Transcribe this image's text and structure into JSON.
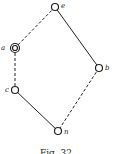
{
  "figure": {
    "caption": "Fig. 32",
    "nodes": [
      {
        "id": "e",
        "label": "e",
        "x": 55,
        "y": 7,
        "double": false
      },
      {
        "id": "a",
        "label": "a",
        "x": 15,
        "y": 48,
        "double": true
      },
      {
        "id": "b",
        "label": "b",
        "x": 99,
        "y": 68,
        "double": false
      },
      {
        "id": "c",
        "label": "c",
        "x": 15,
        "y": 90,
        "double": false
      },
      {
        "id": "n",
        "label": "n",
        "x": 58,
        "y": 131,
        "double": false
      }
    ],
    "edges": [
      {
        "from": "e",
        "to": "a",
        "style": "dashed"
      },
      {
        "from": "e",
        "to": "b",
        "style": "solid"
      },
      {
        "from": "a",
        "to": "c",
        "style": "dashed"
      },
      {
        "from": "c",
        "to": "n",
        "style": "solid"
      },
      {
        "from": "b",
        "to": "n",
        "style": "dashed"
      }
    ]
  }
}
